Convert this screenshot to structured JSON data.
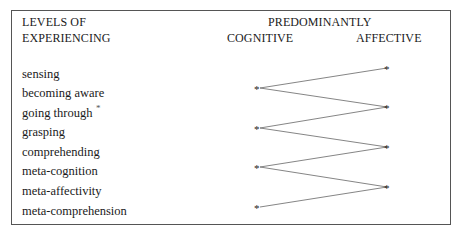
{
  "header": {
    "left_line1": "LEVELS OF",
    "left_line2": "EXPERIENCING",
    "group_title": "PREDOMINANTLY",
    "col_cognitive": "COGNITIVE",
    "col_affective": "AFFECTIVE"
  },
  "levels": [
    {
      "label": "sensing",
      "column": "affective"
    },
    {
      "label": "becoming aware",
      "column": "cognitive"
    },
    {
      "label": "going through",
      "column": "affective"
    },
    {
      "label": "grasping",
      "column": "cognitive"
    },
    {
      "label": "comprehending",
      "column": "affective"
    },
    {
      "label": "meta-cognition",
      "column": "cognitive"
    },
    {
      "label": "meta-affectivity",
      "column": "affective"
    },
    {
      "label": "meta-comprehension",
      "column": "cognitive"
    }
  ],
  "marker": "*",
  "stray_mark": "*"
}
